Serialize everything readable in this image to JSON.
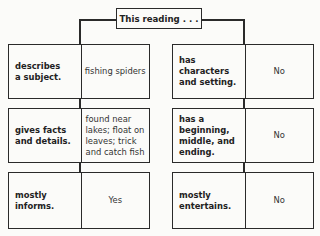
{
  "title": "This reading . . .",
  "left_column": [
    {
      "label": "describes\na subject.",
      "value": "fishing spiders"
    },
    {
      "label": "gives facts\nand details.",
      "value": "found near\nlakes; float on\nleaves; trick\nand catch fish"
    },
    {
      "label": "mostly\ninforms.",
      "value": "Yes"
    }
  ],
  "right_column": [
    {
      "label": "has\ncharacters\nand setting.",
      "value": "No"
    },
    {
      "label": "has a\nbeginning,\nmiddle, and\nending.",
      "value": "No"
    },
    {
      "label": "mostly\nentertains.",
      "value": "No"
    }
  ]
}
